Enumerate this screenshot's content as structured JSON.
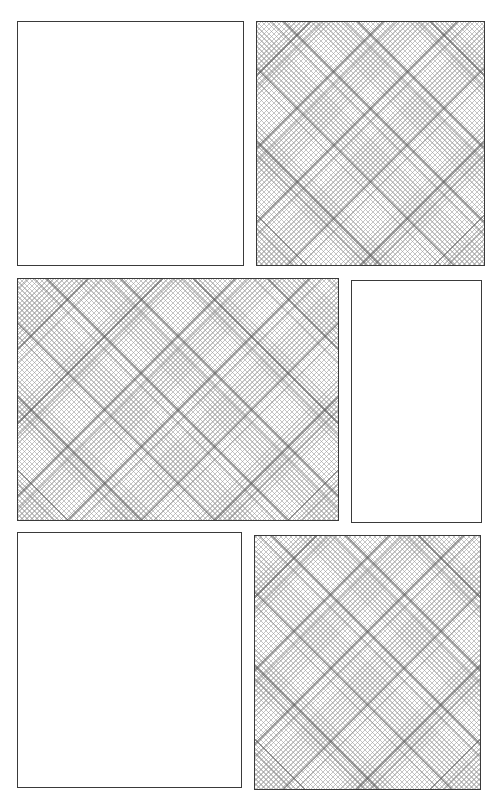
{
  "page": {
    "type": "comic-panel-layout",
    "background": "#ffffff",
    "border_color": "#3a3a3a",
    "tone_color": "#969696"
  },
  "panels": [
    {
      "id": 1,
      "fill": "blank",
      "x": 17,
      "y": 21,
      "width": 227,
      "height": 245
    },
    {
      "id": 2,
      "fill": "crosshatch-tone",
      "x": 256,
      "y": 21,
      "width": 229,
      "height": 245
    },
    {
      "id": 3,
      "fill": "crosshatch-tone",
      "x": 17,
      "y": 278,
      "width": 322,
      "height": 243
    },
    {
      "id": 4,
      "fill": "blank",
      "x": 351,
      "y": 280,
      "width": 131,
      "height": 243
    },
    {
      "id": 5,
      "fill": "blank",
      "x": 17,
      "y": 532,
      "width": 225,
      "height": 256
    },
    {
      "id": 6,
      "fill": "crosshatch-tone",
      "x": 254,
      "y": 535,
      "width": 227,
      "height": 255
    }
  ]
}
